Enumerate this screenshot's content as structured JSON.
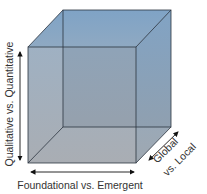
{
  "diagram": {
    "type": "3d-cube",
    "axes": {
      "vertical": "Qualitative vs. Quantitative",
      "horizontal": "Foundational vs. Emergent",
      "depth_line1": "Global",
      "depth_line2": "vs. Local"
    },
    "colors": {
      "top_face": "#93afc8",
      "front_face": "#9fa8b2",
      "side_face": "#97abbf",
      "edge": "#2c3540",
      "arrow": "#111111"
    }
  }
}
